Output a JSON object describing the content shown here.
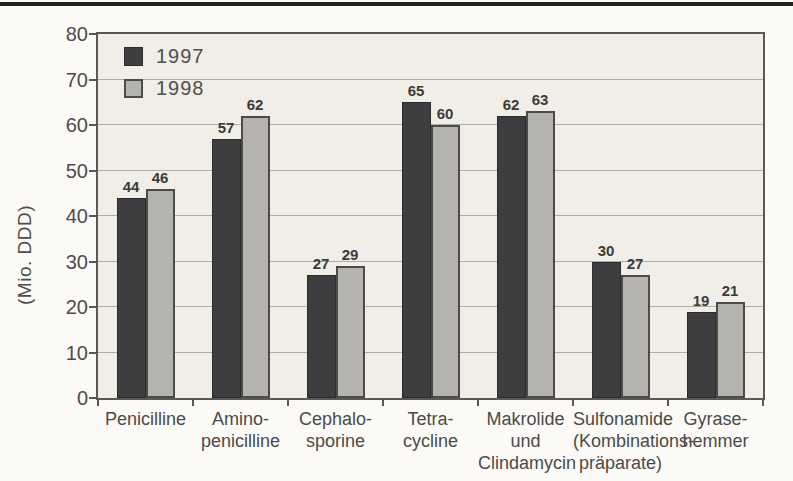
{
  "chart_data": {
    "type": "bar",
    "title": "",
    "xlabel": "",
    "ylabel": "(Mio. DDD)",
    "ylim": [
      0,
      80
    ],
    "ytick_step": 10,
    "grid": true,
    "legend_position": "top-left",
    "value_labels_shown": true,
    "categories": [
      [
        "Penicilline"
      ],
      [
        "Amino-",
        "penicilline"
      ],
      [
        "Cephalo-",
        "sporine"
      ],
      [
        "Tetra-",
        "cycline"
      ],
      [
        "Makrolide",
        "und",
        "Clindamycin"
      ],
      [
        "Sulfonamide",
        "(Kombinations-",
        "präparate)"
      ],
      [
        "Gyrase-",
        "hemmer"
      ]
    ],
    "series": [
      {
        "name": "1997",
        "color": "#3e3d3f",
        "values": [
          44,
          57,
          27,
          65,
          62,
          30,
          19
        ]
      },
      {
        "name": "1998",
        "color": "#b5b3ae",
        "values": [
          46,
          62,
          29,
          60,
          63,
          27,
          21
        ]
      }
    ]
  },
  "colors": {
    "page_background": "#fbfaf6",
    "plot_background": "#f0eee6",
    "plot_border": "#5a5954",
    "gridline": "#9a988f",
    "bar_1997": "#3e3d3f",
    "bar_1998": "#b5b3ae",
    "bar_1998_border": "#4c4b47",
    "text": "#4c4b48",
    "top_rule": "#242321"
  }
}
